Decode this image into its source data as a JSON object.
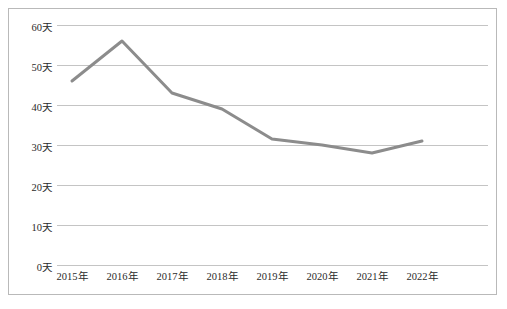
{
  "chart_data": {
    "type": "line",
    "title": "",
    "subtitle": "",
    "xlabel": "",
    "ylabel": "",
    "categories": [
      "2015年",
      "2016年",
      "2017年",
      "2018年",
      "2019年",
      "2020年",
      "2021年",
      "2022年"
    ],
    "values": [
      46,
      56,
      43,
      39,
      31.5,
      30,
      28,
      31
    ],
    "series": [
      {
        "name": "",
        "values": [
          46,
          56,
          43,
          39,
          31.5,
          30,
          28,
          31
        ]
      }
    ],
    "ytick_labels": [
      "0天",
      "10天",
      "20天",
      "30天",
      "40天",
      "50天",
      "60天"
    ],
    "ytick_values": [
      0,
      10,
      20,
      30,
      40,
      50,
      60
    ],
    "ylim": [
      0,
      60
    ],
    "grid": true,
    "legend": "none",
    "line_color": "#8c8c8c",
    "grid_color": "#c4c4c4",
    "border_color": "#b9b9b9",
    "background_color": "#ffffff",
    "text_color": "#2b2b2b"
  }
}
